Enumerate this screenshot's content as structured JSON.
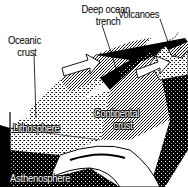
{
  "diagram": {
    "style": "black-and-white textbook illustration",
    "labels": {
      "deep_ocean_trench_line1": "Deep ocean",
      "deep_ocean_trench_line2": "trench",
      "volcanoes": "Volcanoes",
      "oceanic_crust_line1": "Oceanic",
      "oceanic_crust_line2": "crust",
      "lithosphere": "Lithosphere",
      "continental_crust_line1": "Continental",
      "continental_crust_line2": "crust",
      "asthenosphere": "Asthenosphere"
    },
    "arrows": [
      {
        "direction": "right",
        "meaning": "oceanic plate motion toward trench"
      },
      {
        "direction": "right",
        "meaning": "plate convergence"
      }
    ],
    "colors": {
      "ink": "#000000",
      "paper": "#ffffff",
      "mid": "#8a8a8a"
    }
  }
}
